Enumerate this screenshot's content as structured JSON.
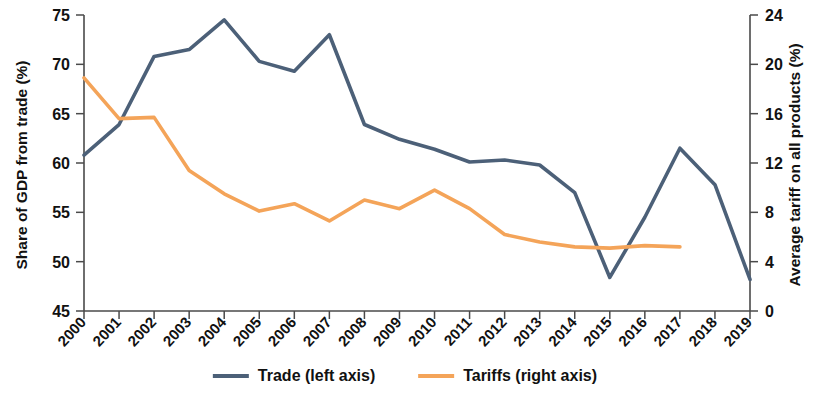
{
  "chart_data": {
    "type": "line",
    "title": "",
    "xlabel": "",
    "grid": false,
    "legend_position": "bottom-center",
    "x": [
      "2000",
      "2001",
      "2002",
      "2003",
      "2004",
      "2005",
      "2006",
      "2007",
      "2008",
      "2009",
      "2010",
      "2011",
      "2012",
      "2013",
      "2014",
      "2015",
      "2016",
      "2017",
      "2018",
      "2019"
    ],
    "categories": [
      "2000",
      "2001",
      "2002",
      "2003",
      "2004",
      "2005",
      "2006",
      "2007",
      "2008",
      "2009",
      "2010",
      "2011",
      "2012",
      "2013",
      "2014",
      "2015",
      "2016",
      "2017",
      "2018",
      "2019"
    ],
    "axes": {
      "left": {
        "label": "Share of GDP from trade (%)",
        "ticks": [
          45,
          50,
          55,
          60,
          65,
          70,
          75
        ],
        "lim": [
          45,
          75
        ]
      },
      "right": {
        "label": "Average tariff on all products (%)",
        "ticks": [
          0,
          4,
          8,
          12,
          16,
          20,
          24
        ],
        "lim": [
          0,
          24
        ]
      }
    },
    "series": [
      {
        "name": "Trade (left axis)",
        "axis": "left",
        "color": "#4c6078",
        "values": [
          60.8,
          63.9,
          70.8,
          71.5,
          74.5,
          70.3,
          69.3,
          73.0,
          63.9,
          62.4,
          61.4,
          60.1,
          60.3,
          59.8,
          57.0,
          48.4,
          54.5,
          61.5,
          57.8,
          48.2
        ]
      },
      {
        "name": "Tariffs (right axis)",
        "axis": "right",
        "color": "#f4a459",
        "values": [
          18.9,
          15.6,
          15.7,
          11.4,
          9.5,
          8.1,
          8.7,
          7.3,
          9.0,
          8.3,
          9.8,
          8.3,
          6.2,
          5.6,
          5.2,
          5.1,
          5.3,
          5.2,
          null,
          null
        ]
      }
    ]
  },
  "legend": {
    "items": [
      {
        "label": "Trade (left axis)",
        "color": "#4c6078"
      },
      {
        "label": "Tariffs (right axis)",
        "color": "#f4a459"
      }
    ]
  },
  "labels": {
    "left_axis_title": "Share of GDP from trade (%)",
    "right_axis_title": "Average tariff on all products (%)"
  }
}
